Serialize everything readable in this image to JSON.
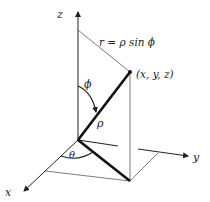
{
  "diagram": {
    "labels": {
      "z_axis": "z",
      "y_axis": "y",
      "x_axis": "x",
      "r_formula": "r = ρ sin ϕ",
      "point": "(x, y, z)",
      "phi": "ϕ",
      "rho": "ρ",
      "theta": "θ"
    },
    "colors": {
      "line": "#222222",
      "thin_line": "#444444",
      "background": "#ffffff"
    }
  }
}
